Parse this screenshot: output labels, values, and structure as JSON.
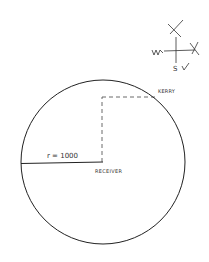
{
  "diagram": {
    "circle": {
      "cx": 103,
      "cy": 162,
      "r": 82,
      "stroke": "#222222"
    },
    "radius_label": "r = 1000",
    "center_label": "RECEIVER",
    "point_label": "KERRY",
    "compass": {
      "west": "W✓",
      "south": "S ✓",
      "north_mark": "✗",
      "east_mark": "✗"
    }
  }
}
